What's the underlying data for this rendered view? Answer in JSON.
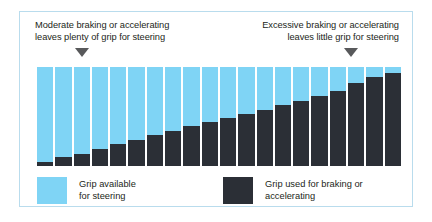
{
  "figure": {
    "border_color": "#b9dced",
    "background": "#ffffff"
  },
  "callouts": {
    "left": {
      "line1": "Moderate braking or accelerating",
      "line2": "leaves plenty of grip for steering",
      "marker": "down-triangle"
    },
    "right": {
      "line1": "Excessive braking or accelerating",
      "line2": "leaves little grip for steering",
      "marker": "down-triangle"
    }
  },
  "legend": {
    "available": {
      "line1": "Grip available",
      "line2": "for steering",
      "color": "#7fd4f5"
    },
    "used": {
      "line1": "Grip used for braking or",
      "line2": "accelerating",
      "color": "#2b2f36"
    }
  },
  "chart_data": {
    "type": "bar",
    "title": "",
    "subtitle": "",
    "xlabel": "",
    "ylabel": "",
    "ylim": [
      0,
      100
    ],
    "grid": false,
    "legend_position": "bottom",
    "stacked": true,
    "categories": [
      "1",
      "2",
      "3",
      "4",
      "5",
      "6",
      "7",
      "8",
      "9",
      "10",
      "11",
      "12",
      "13",
      "14",
      "15",
      "16",
      "17",
      "18",
      "19",
      "20"
    ],
    "series": [
      {
        "name": "Grip used for braking or accelerating",
        "color": "#2b2f36",
        "values": [
          4,
          9,
          12,
          17,
          22,
          26,
          31,
          35,
          40,
          44,
          48,
          53,
          57,
          62,
          66,
          71,
          76,
          84,
          90,
          94
        ]
      },
      {
        "name": "Grip available for steering",
        "color": "#7fd4f5",
        "values": [
          96,
          91,
          88,
          83,
          78,
          74,
          69,
          65,
          60,
          56,
          52,
          47,
          43,
          38,
          34,
          29,
          24,
          16,
          10,
          6
        ]
      }
    ],
    "annotations": [
      {
        "text": "Moderate braking or accelerating leaves plenty of grip for steering",
        "points_to_category": "3"
      },
      {
        "text": "Excessive braking or accelerating leaves little grip for steering",
        "points_to_category": "18"
      }
    ]
  }
}
